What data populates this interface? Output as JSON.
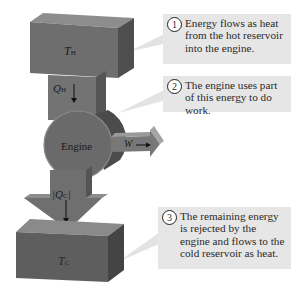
{
  "diagram": {
    "type": "heat-engine-energy-flow",
    "hot_reservoir": {
      "label": "T",
      "subscript": "H"
    },
    "cold_reservoir": {
      "label": "T",
      "subscript": "C"
    },
    "heat_in": {
      "label": "Q",
      "subscript": "H"
    },
    "heat_out": {
      "label": "|Q",
      "subscript": "C",
      "suffix": "|"
    },
    "engine": {
      "label": "Engine"
    },
    "work": {
      "label": "W"
    },
    "colors": {
      "block_front": "#6e6e6e",
      "block_top": "#8d8d8d",
      "block_side": "#4e4e4e",
      "engine": "#6a6a6a",
      "callout_bg": "#e6e6e6",
      "pointer": "#e3e3e3"
    }
  },
  "callouts": [
    {
      "number": "1",
      "text": "Energy flows as heat from the hot reservoir into the engine."
    },
    {
      "number": "2",
      "text": "The engine uses part of this energy to do work."
    },
    {
      "number": "3",
      "text": "The remaining energy is rejected by the engine and flows to the cold reservoir as heat."
    }
  ]
}
